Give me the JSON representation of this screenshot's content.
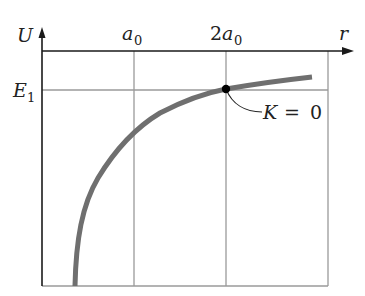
{
  "diagram": {
    "type": "potential-energy-graph",
    "axes": {
      "vertical_label": "U",
      "horizontal_label": "r"
    },
    "tick_labels": {
      "a0": {
        "base": "a",
        "subscript": "0"
      },
      "two_a0": {
        "prefix": "2",
        "base": "a",
        "subscript": "0"
      },
      "E1": {
        "base": "E",
        "subscript": "1"
      }
    },
    "annotation": {
      "K": "K",
      "equals": " = ",
      "zero": "0"
    },
    "colors": {
      "curve": "#6f6f6f",
      "grid": "#9a9a9a",
      "axis": "#1a1a1a",
      "point": "#000000"
    }
  }
}
